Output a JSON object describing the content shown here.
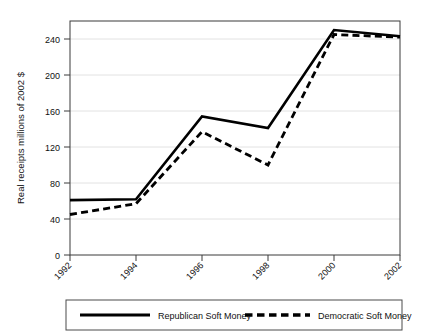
{
  "chart_data": {
    "type": "line",
    "title": "",
    "xlabel": "",
    "ylabel": "Real receipts millions of 2002 $",
    "categories": [
      "1992",
      "1994",
      "1996",
      "1998",
      "2000",
      "2002"
    ],
    "x": [
      1992,
      1994,
      1996,
      1998,
      2000,
      2002
    ],
    "series": [
      {
        "name": "Republican Soft Money",
        "style": "solid",
        "color": "#000000",
        "values": [
          61,
          62,
          154,
          141,
          250,
          243
        ]
      },
      {
        "name": "Democratic Soft Money",
        "style": "dashed",
        "color": "#000000",
        "values": [
          45,
          57,
          137,
          100,
          245,
          242
        ]
      }
    ],
    "ylim": [
      0,
      260
    ],
    "yticks": [
      0,
      40,
      80,
      120,
      160,
      200,
      240
    ],
    "ytick_labels": [
      "0",
      "40",
      "80",
      "120",
      "160",
      "200",
      "240"
    ],
    "xtick_labels": [
      "1992",
      "1994",
      "1996",
      "1998",
      "2000",
      "2002"
    ],
    "xtick_rotation": -45,
    "grid": "horizontal",
    "grid_color": "#e2e2e2",
    "legend_position": "below-plot",
    "frame": true,
    "background": "#ffffff"
  },
  "legend": {
    "entries": [
      {
        "label": "Republican Soft Money",
        "style": "solid"
      },
      {
        "label": "Democratic Soft Money",
        "style": "dashed"
      }
    ]
  }
}
